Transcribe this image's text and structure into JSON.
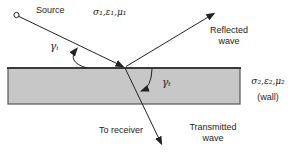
{
  "diagram": {
    "labels": {
      "source": "Source",
      "medium1_params": "σ₁,ε₁,μ₁",
      "reflected_wave": "Reflected\nwave",
      "incidence_angle": "γᵢ",
      "transmission_angle": "γₜ",
      "medium2_params": "σ₂,ε₂,μ₂",
      "medium2_name": "(wall)",
      "to_receiver": "To receiver",
      "transmitted_wave": "Transmitted\nwave"
    },
    "colors": {
      "background": "#ffffff",
      "wall_fill": "#c7c7c7",
      "wall_edge": "#555555",
      "wall_top_edge": "#3a3a3a",
      "line": "#222222"
    }
  }
}
